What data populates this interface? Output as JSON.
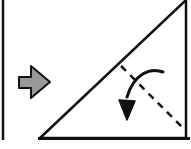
{
  "diagram": {
    "type": "origami-fold-step",
    "colors": {
      "line": "#111111",
      "arrow_fill": "#999999",
      "background": "#ffffff"
    },
    "icons": {
      "step_arrow": "right-arrow-icon",
      "fold_arrow": "curved-fold-arrow-icon"
    }
  }
}
